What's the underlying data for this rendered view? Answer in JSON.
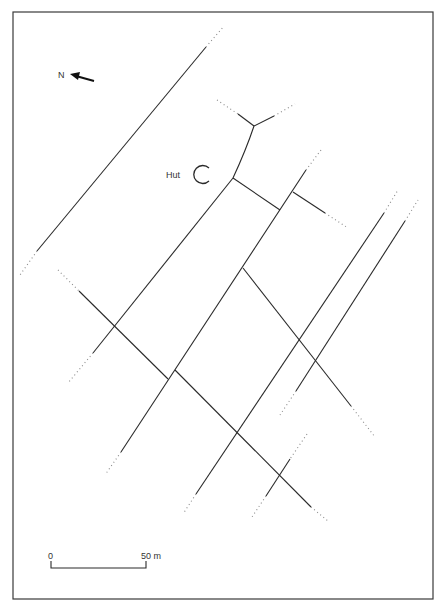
{
  "map": {
    "hut_label": "Hut",
    "north_label": "N",
    "scale": {
      "start_label": "0",
      "end_label": "50 m"
    },
    "colors": {
      "line": "#2a2a2a",
      "frame": "#3a3a3a",
      "dotted": "#8a8a8a"
    }
  },
  "solid_lines": [
    [
      206,
      47,
      37,
      251
    ],
    [
      79,
      291,
      168,
      379
    ],
    [
      233,
      178,
      93,
      353
    ],
    [
      306,
      170,
      121,
      452
    ],
    [
      233,
      178,
      280,
      210
    ],
    [
      293,
      192,
      325,
      213
    ],
    [
      243,
      268,
      351,
      406
    ],
    [
      384,
      213,
      196,
      494
    ],
    [
      405,
      221,
      296,
      391
    ],
    [
      175,
      370,
      311,
      507
    ],
    [
      290,
      459,
      266,
      496
    ],
    [
      238,
      114,
      254,
      126
    ],
    [
      254,
      126,
      274,
      116
    ]
  ],
  "dotted_lines": [
    [
      206,
      47,
      224,
      26
    ],
    [
      37,
      251,
      20,
      275
    ],
    [
      58,
      270,
      79,
      291
    ],
    [
      93,
      353,
      68,
      383
    ],
    [
      121,
      452,
      105,
      475
    ],
    [
      217,
      100,
      238,
      114
    ],
    [
      274,
      116,
      295,
      104
    ],
    [
      306,
      170,
      321,
      150
    ],
    [
      325,
      213,
      348,
      228
    ],
    [
      384,
      213,
      398,
      190
    ],
    [
      405,
      221,
      418,
      200
    ],
    [
      351,
      406,
      375,
      437
    ],
    [
      296,
      391,
      280,
      415
    ],
    [
      196,
      494,
      183,
      514
    ],
    [
      311,
      507,
      328,
      521
    ],
    [
      307,
      434,
      290,
      459
    ],
    [
      266,
      496,
      252,
      517
    ]
  ]
}
